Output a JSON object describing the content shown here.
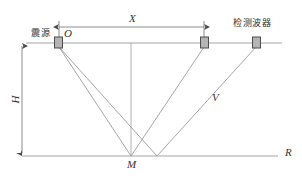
{
  "figure": {
    "type": "seismic-reflection-diagram",
    "background": "#ffffff",
    "line_color": "#8c8c8c",
    "marker_fill": "#b4b4b4",
    "marker_stroke": "#4d4d4d",
    "text_color": "#333333"
  },
  "labels": {
    "source": "震源",
    "detector": "检测波器",
    "origin_point": "O",
    "offset_dimension": "X",
    "depth_dimension": "H",
    "velocity_ray": "V",
    "reflection_point": "M",
    "reflector_line": "R"
  },
  "geometry": {
    "surface_line_y": 43,
    "reflector_line_y": 156,
    "surface_x_start": 26,
    "surface_x_end": 282,
    "reflector_x_start": 22,
    "reflector_x_end": 278,
    "source_x": 58,
    "receiver1_x": 204,
    "receiver2_x": 256,
    "reflection_m_x": 131,
    "reflection_b_x": 157,
    "dimension_line_y": 27,
    "depth_dimension_x": 22
  },
  "markers": [
    {
      "name": "source-marker",
      "x": 58,
      "label": "震源"
    },
    {
      "name": "receiver-marker-1",
      "x": 204,
      "label": ""
    },
    {
      "name": "receiver-marker-2",
      "x": 256,
      "label": "检测波器"
    }
  ]
}
